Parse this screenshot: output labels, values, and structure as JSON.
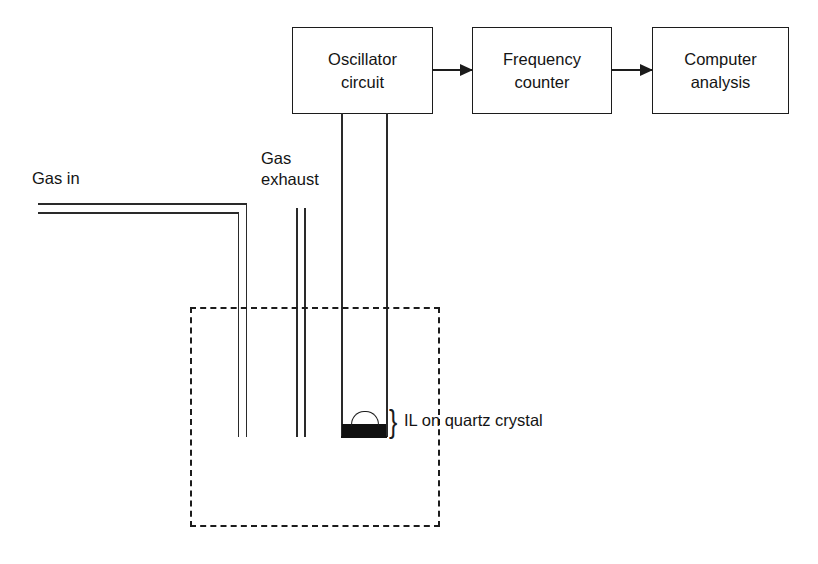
{
  "diagram": {
    "blocks": [
      {
        "id": "oscillator",
        "line1": "Oscillator",
        "line2": "circuit"
      },
      {
        "id": "counter",
        "line1": "Frequency",
        "line2": "counter"
      },
      {
        "id": "computer",
        "line1": "Computer",
        "line2": "analysis"
      }
    ],
    "labels": {
      "gas_in": "Gas in",
      "gas_exhaust_line1": "Gas",
      "gas_exhaust_line2": "exhaust",
      "crystal_callout": "IL on quartz crystal",
      "brace_glyph": "}"
    },
    "colors": {
      "background": "#ffffff",
      "stroke": "#1c1c1c",
      "pipe_stroke": "#2a2a2a",
      "crystal_fill": "#111111",
      "text": "#141414"
    },
    "flow": [
      {
        "from": "oscillator",
        "to": "counter",
        "kind": "arrow"
      },
      {
        "from": "counter",
        "to": "computer",
        "kind": "arrow"
      }
    ]
  }
}
